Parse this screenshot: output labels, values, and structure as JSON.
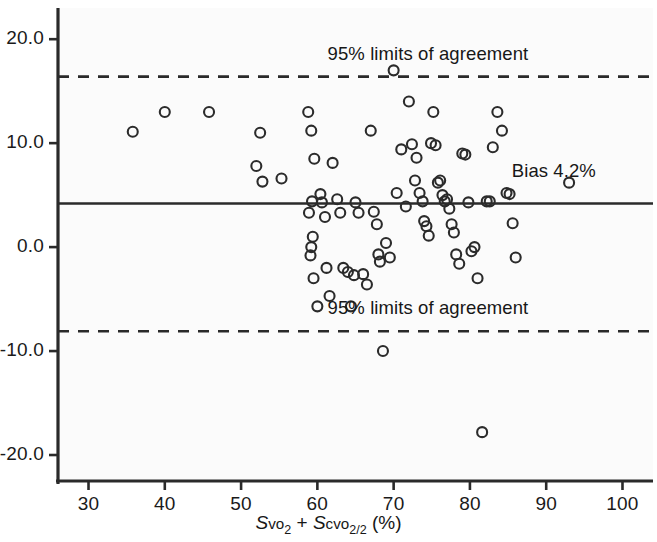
{
  "chart_data": {
    "type": "scatter",
    "title": "",
    "subtitle": "",
    "xlabel": "Svo2 + Scvo2/2 (%)",
    "xlabel_parts": {
      "s1": "S",
      "vo1": "vo",
      "sub1": "2",
      "plus": " + ",
      "s2": "S",
      "cvo2": "cvo",
      "sub2": "2/2",
      "percent": " (%)"
    },
    "ylabel": "",
    "xlim": [
      26,
      104
    ],
    "ylim": [
      -22.5,
      23.0
    ],
    "xticks": [
      30,
      40,
      50,
      60,
      70,
      80,
      90,
      100
    ],
    "xtick_labels": [
      "30",
      "40",
      "50",
      "60",
      "70",
      "80",
      "90",
      "100"
    ],
    "yticks": [
      20,
      10,
      0,
      -10,
      -20
    ],
    "ytick_labels": [
      "20.0",
      "10.0",
      "0.0",
      "-10.0",
      "-20.0"
    ],
    "grid": false,
    "legend": "none",
    "marker": "open-circle",
    "marker_color": "#2b2b2b",
    "marker_radius": 5.0,
    "reference_lines": [
      {
        "name": "upper-limit-of-agreement",
        "value": 16.4,
        "style": "dashed",
        "label": "95% limits of agreement"
      },
      {
        "name": "bias",
        "value": 4.2,
        "style": "solid",
        "label": "Bias 4.2%"
      },
      {
        "name": "lower-limit-of-agreement",
        "value": -8.1,
        "style": "dashed",
        "label": "95% limits of agreement"
      }
    ],
    "annotations": [
      {
        "name": "upper-loa-label",
        "text": "95% limits of agreement",
        "x": 74.5,
        "y": 18.6
      },
      {
        "name": "bias-label",
        "text": "Bias 4.2%",
        "x": 91.0,
        "y": 7.3
      },
      {
        "name": "lower-loa-label",
        "text": "95% limits of agreement",
        "x": 74.5,
        "y": -5.9
      }
    ],
    "x": [
      35.8,
      40.0,
      45.8,
      52.5,
      52.0,
      52.8,
      55.3,
      58.8,
      59.2,
      59.6,
      59.3,
      58.9,
      59.4,
      59.2,
      59.1,
      59.5,
      60.0,
      60.4,
      60.6,
      61.0,
      61.2,
      61.6,
      62.0,
      62.6,
      63.0,
      63.4,
      64.0,
      64.4,
      64.8,
      65.0,
      65.4,
      66.0,
      66.5,
      67.0,
      67.4,
      67.8,
      68.0,
      68.2,
      68.6,
      69.0,
      69.5,
      70.0,
      70.4,
      71.0,
      71.6,
      72.0,
      72.4,
      72.8,
      73.0,
      73.4,
      73.8,
      74.0,
      74.3,
      74.6,
      74.9,
      75.2,
      75.5,
      75.8,
      76.1,
      76.4,
      76.7,
      77.0,
      77.3,
      77.6,
      77.9,
      78.2,
      78.6,
      79.0,
      79.4,
      79.8,
      80.2,
      80.6,
      81.0,
      81.6,
      82.2,
      82.6,
      83.0,
      83.6,
      84.2,
      84.8,
      85.2,
      85.6,
      86.0,
      93.0
    ],
    "y": [
      11.1,
      13.0,
      13.0,
      11.0,
      7.8,
      6.3,
      6.6,
      13.0,
      11.2,
      8.5,
      4.4,
      3.3,
      1.0,
      0.0,
      -0.8,
      -3.0,
      -5.7,
      5.1,
      4.3,
      2.9,
      -2.0,
      -4.7,
      8.1,
      4.6,
      3.3,
      -2.0,
      -2.4,
      -5.7,
      -2.7,
      4.3,
      3.3,
      -2.6,
      -3.6,
      11.2,
      3.4,
      2.2,
      -0.7,
      -1.4,
      -10.0,
      0.4,
      -1.0,
      17.0,
      5.2,
      9.4,
      3.9,
      14.0,
      9.9,
      6.4,
      8.6,
      5.2,
      4.4,
      2.5,
      2.0,
      1.1,
      10.0,
      13.0,
      9.8,
      6.2,
      6.4,
      5.0,
      4.4,
      4.6,
      3.7,
      2.2,
      1.4,
      -0.7,
      -1.6,
      9.0,
      8.9,
      4.3,
      -0.4,
      0.0,
      -3.0,
      -17.8,
      4.4,
      4.4,
      9.6,
      13.0,
      11.2,
      5.2,
      5.1,
      2.3,
      -1.0,
      6.2
    ]
  }
}
